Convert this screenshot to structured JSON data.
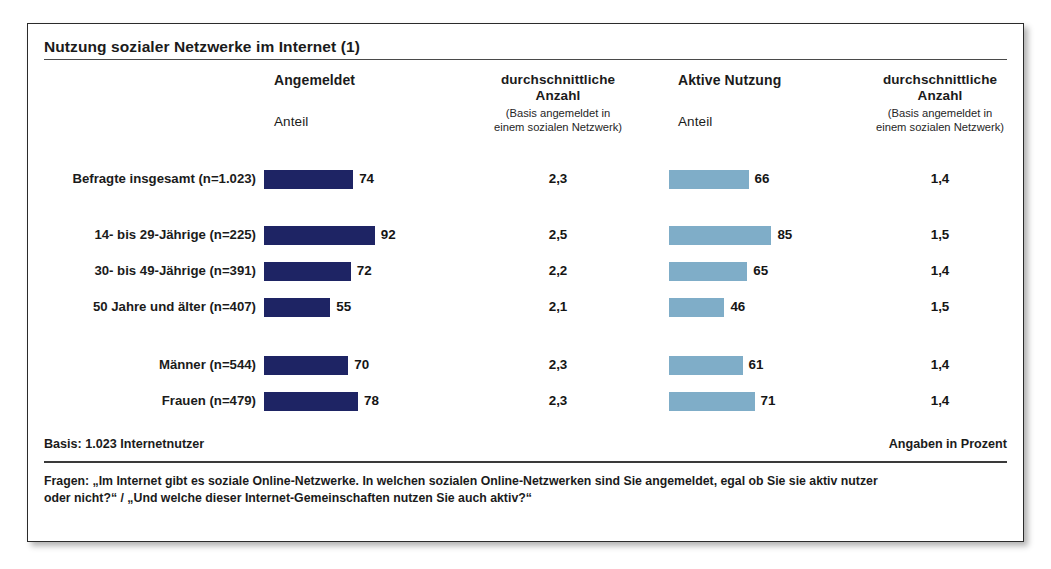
{
  "title": "Nutzung sozialer Netzwerke im Internet (1)",
  "headers": {
    "col_a_main": "Angemeldet",
    "col_a_sub": "Anteil",
    "col_b_main": "durchschnittliche",
    "col_b_main2": "Anzahl",
    "col_b_paren1": "(Basis angemeldet in",
    "col_b_paren2": "einem sozialen Netzwerk)",
    "col_c_main": "Aktive Nutzung",
    "col_c_sub": "Anteil",
    "col_d_main": "durchschnittliche",
    "col_d_main2": "Anzahl",
    "col_d_paren1": "(Basis angemeldet in",
    "col_d_paren2": "einem sozialen Netzwerk)"
  },
  "footer": {
    "basis": "Basis: 1.023 Internetnutzer",
    "angaben": "Angaben in Prozent",
    "question_line1": "Fragen:  „Im Internet gibt es soziale Online-Netzwerke. In welchen sozialen Online-Netzwerken sind Sie angemeldet, egal ob Sie sie aktiv nutzer",
    "question_line2": "oder nicht?“ / „Und welche dieser Internet-Gemeinschaften nutzen Sie auch aktiv?“"
  },
  "colors": {
    "bar_angemeldet": "#1e2464",
    "bar_aktive_nutzung": "#7fadc8",
    "frame": "#2b2b2b",
    "text": "#1b1b1b"
  },
  "chart_data": {
    "type": "bar",
    "title": "Nutzung sozialer Netzwerke im Internet (1)",
    "xlabel": "",
    "ylabel": "",
    "xlim": [
      0,
      100
    ],
    "grid": false,
    "orientation": "horizontal",
    "units": "Prozent",
    "basis": "1.023 Internetnutzer",
    "categories": [
      "Befragte insgesamt (n=1.023)",
      "14- bis 29-Jährige (n=225)",
      "30- bis 49-Jährige (n=391)",
      "50 Jahre und älter (n=407)",
      "Männer (n=544)",
      "Frauen (n=479)"
    ],
    "series": [
      {
        "name": "Angemeldet Anteil",
        "color": "#1e2464",
        "values": [
          74,
          92,
          72,
          55,
          70,
          78
        ]
      },
      {
        "name": "durchschnittliche Anzahl (Basis angemeldet in einem sozialen Netzwerk)",
        "color": null,
        "values": [
          "2,3",
          "2,5",
          "2,2",
          "2,1",
          "2,3",
          "2,3"
        ]
      },
      {
        "name": "Aktive Nutzung Anteil",
        "color": "#7fadc8",
        "values": [
          66,
          85,
          65,
          46,
          61,
          71
        ]
      },
      {
        "name": "durchschnittliche Anzahl (Basis angemeldet in einem sozialen Netzwerk)",
        "color": null,
        "values": [
          "1,4",
          "1,5",
          "1,4",
          "1,5",
          "1,4",
          "1,4"
        ]
      }
    ]
  },
  "rows": [
    {
      "label": "Befragte insgesamt (n=1.023)",
      "angemeldet": 74,
      "anzahl1": "2,3",
      "aktiv": 66,
      "anzahl2": "1,4",
      "top": 0
    },
    {
      "label": "14- bis 29-Jährige (n=225)",
      "angemeldet": 92,
      "anzahl1": "2,5",
      "aktiv": 85,
      "anzahl2": "1,5",
      "top": 56
    },
    {
      "label": "30- bis 49-Jährige (n=391)",
      "angemeldet": 72,
      "anzahl1": "2,2",
      "aktiv": 65,
      "anzahl2": "1,4",
      "top": 92
    },
    {
      "label": "50 Jahre und älter (n=407)",
      "angemeldet": 55,
      "anzahl1": "2,1",
      "aktiv": 46,
      "anzahl2": "1,5",
      "top": 128
    },
    {
      "label": "Männer (n=544)",
      "angemeldet": 70,
      "anzahl1": "2,3",
      "aktiv": 61,
      "anzahl2": "1,4",
      "top": 186
    },
    {
      "label": "Frauen (n=479)",
      "angemeldet": 78,
      "anzahl1": "2,3",
      "aktiv": 71,
      "anzahl2": "1,4",
      "top": 222
    }
  ]
}
